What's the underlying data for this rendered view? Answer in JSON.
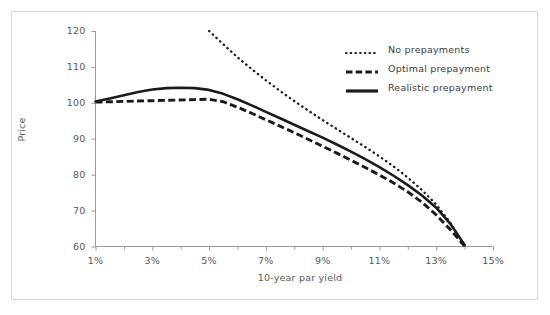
{
  "chart_data": {
    "type": "line",
    "title": "",
    "xlabel": "10-year par yield",
    "ylabel": "Price",
    "xlim": [
      1,
      15
    ],
    "ylim": [
      60,
      120
    ],
    "xticks": [
      "1%",
      "3%",
      "5%",
      "7%",
      "9%",
      "11%",
      "13%",
      "15%"
    ],
    "xtick_values": [
      1,
      3,
      5,
      7,
      9,
      11,
      13,
      15
    ],
    "xminor_step": 1,
    "yticks": [
      "60",
      "70",
      "80",
      "90",
      "100",
      "110",
      "120"
    ],
    "ytick_values": [
      60,
      70,
      80,
      90,
      100,
      110,
      120
    ],
    "grid": false,
    "legend_position": "upper right",
    "series": [
      {
        "name": "No prepayments",
        "style": "dotted",
        "color": "#1a1a1a",
        "x": [
          5.0,
          5.5,
          6.0,
          6.5,
          7.0,
          7.5,
          8.0,
          8.5,
          9.0,
          9.5,
          10.0,
          10.5,
          11.0,
          11.5,
          12.0,
          12.5,
          13.0,
          13.5,
          14.0
        ],
        "y": [
          120.0,
          116.3,
          112.7,
          109.4,
          106.3,
          103.3,
          100.5,
          97.8,
          95.2,
          92.7,
          90.2,
          87.7,
          85.1,
          82.3,
          79.2,
          75.7,
          71.7,
          66.6,
          60.2
        ]
      },
      {
        "name": "Optimal prepayment",
        "style": "dashed",
        "color": "#1a1a1a",
        "x": [
          1.0,
          1.5,
          2.0,
          2.5,
          3.0,
          3.5,
          4.0,
          4.5,
          5.0,
          5.5,
          6.0,
          6.5,
          7.0,
          7.5,
          8.0,
          8.5,
          9.0,
          9.5,
          10.0,
          10.5,
          11.0,
          11.5,
          12.0,
          12.5,
          13.0,
          13.5,
          14.0
        ],
        "y": [
          100.2,
          100.3,
          100.4,
          100.5,
          100.6,
          100.7,
          100.8,
          100.9,
          101.0,
          100.3,
          98.8,
          97.1,
          95.3,
          93.5,
          91.7,
          89.8,
          87.9,
          86.0,
          84.0,
          82.0,
          79.9,
          77.7,
          75.2,
          72.3,
          68.8,
          64.7,
          60.1
        ]
      },
      {
        "name": "Realistic prepayment",
        "style": "solid",
        "color": "#1a1a1a",
        "x": [
          1.0,
          1.5,
          2.0,
          2.5,
          3.0,
          3.5,
          4.0,
          4.5,
          5.0,
          5.5,
          6.0,
          6.5,
          7.0,
          7.5,
          8.0,
          8.5,
          9.0,
          9.5,
          10.0,
          10.5,
          11.0,
          11.5,
          12.0,
          12.5,
          13.0,
          13.5,
          14.0
        ],
        "y": [
          100.4,
          101.2,
          102.1,
          103.0,
          103.7,
          104.1,
          104.2,
          104.1,
          103.6,
          102.5,
          101.0,
          99.3,
          97.5,
          95.7,
          93.9,
          92.1,
          90.3,
          88.4,
          86.4,
          84.3,
          82.1,
          79.7,
          77.1,
          74.2,
          70.8,
          66.3,
          60.4
        ]
      }
    ]
  },
  "legend": {
    "items": [
      {
        "label": "No prepayments",
        "style": "dotted"
      },
      {
        "label": "Optimal prepayment",
        "style": "dashed"
      },
      {
        "label": "Realistic prepayment",
        "style": "solid"
      }
    ]
  },
  "axes": {
    "y_title": "Price",
    "x_title": "10-year par yield",
    "y_labels": [
      "120",
      "110",
      "100",
      "90",
      "80",
      "70",
      "60"
    ],
    "x_labels": [
      "1%",
      "3%",
      "5%",
      "7%",
      "9%",
      "11%",
      "13%",
      "15%"
    ]
  },
  "colors": {
    "line": "#1a1a1a",
    "axis": "#9a9a9a",
    "text": "#58585a",
    "frame": "#d8d8d8",
    "background": "#ffffff"
  }
}
